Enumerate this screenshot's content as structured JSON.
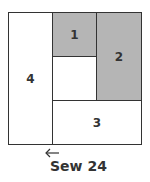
{
  "diagram": {
    "type": "quilt-block-piecing",
    "pieces": [
      {
        "id": "piece-1",
        "label": "1",
        "shaded": true
      },
      {
        "id": "piece-2",
        "label": "2",
        "shaded": true
      },
      {
        "id": "piece-3",
        "label": "3",
        "shaded": false
      },
      {
        "id": "piece-4",
        "label": "4",
        "shaded": false
      },
      {
        "id": "piece-center",
        "label": "",
        "shaded": false
      }
    ],
    "arrow": {
      "direction": "left",
      "icon": "arrow-left-icon"
    },
    "caption": "Sew 24",
    "colors": {
      "shaded": "#b5b5b5",
      "line": "#333333",
      "background": "#ffffff"
    }
  }
}
